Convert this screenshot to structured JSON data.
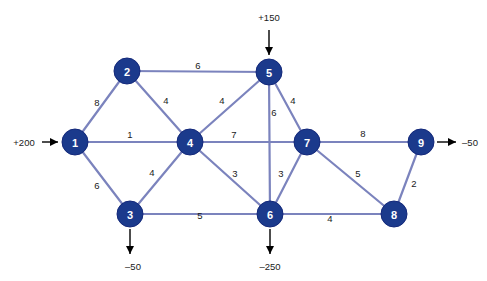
{
  "diagram": {
    "colors": {
      "node_fill": "#1b3a8c",
      "node_text": "#ffffff",
      "edge": "#7b83bd",
      "label": "#1a1a1a",
      "background": "#ffffff",
      "arrow": "#000000"
    },
    "nodes": [
      {
        "id": "1",
        "label": "1",
        "cx": 75,
        "cy": 142,
        "r": 13
      },
      {
        "id": "2",
        "label": "2",
        "cx": 127,
        "cy": 71,
        "r": 13
      },
      {
        "id": "3",
        "label": "3",
        "cx": 130,
        "cy": 214,
        "r": 13
      },
      {
        "id": "4",
        "label": "4",
        "cx": 190,
        "cy": 142,
        "r": 13
      },
      {
        "id": "5",
        "label": "5",
        "cx": 269,
        "cy": 72,
        "r": 13
      },
      {
        "id": "6",
        "label": "6",
        "cx": 270,
        "cy": 214,
        "r": 13
      },
      {
        "id": "7",
        "label": "7",
        "cx": 307,
        "cy": 142,
        "r": 13
      },
      {
        "id": "8",
        "label": "8",
        "cx": 394,
        "cy": 214,
        "r": 13
      },
      {
        "id": "9",
        "label": "9",
        "cx": 421,
        "cy": 142,
        "r": 13
      }
    ],
    "edges": [
      {
        "from": "1",
        "to": "2",
        "weight": "8",
        "lx": 97,
        "ly": 102
      },
      {
        "from": "1",
        "to": "4",
        "weight": "1",
        "lx": 130,
        "ly": 134
      },
      {
        "from": "1",
        "to": "3",
        "weight": "6",
        "lx": 97,
        "ly": 185
      },
      {
        "from": "2",
        "to": "5",
        "weight": "6",
        "lx": 198,
        "ly": 65
      },
      {
        "from": "2",
        "to": "4",
        "weight": "4",
        "lx": 166,
        "ly": 100
      },
      {
        "from": "3",
        "to": "4",
        "weight": "4",
        "lx": 152,
        "ly": 172
      },
      {
        "from": "3",
        "to": "6",
        "weight": "5",
        "lx": 200,
        "ly": 215
      },
      {
        "from": "4",
        "to": "5",
        "weight": "4",
        "lx": 222,
        "ly": 100
      },
      {
        "from": "4",
        "to": "7",
        "weight": "7",
        "lx": 234,
        "ly": 134
      },
      {
        "from": "4",
        "to": "6",
        "weight": "3",
        "lx": 235,
        "ly": 173
      },
      {
        "from": "5",
        "to": "6",
        "weight": "6",
        "lx": 274,
        "ly": 112
      },
      {
        "from": "5",
        "to": "7",
        "weight": "4",
        "lx": 293,
        "ly": 100
      },
      {
        "from": "6",
        "to": "7",
        "weight": "3",
        "lx": 281,
        "ly": 173
      },
      {
        "from": "6",
        "to": "8",
        "weight": "4",
        "lx": 330,
        "ly": 218
      },
      {
        "from": "7",
        "to": "8",
        "weight": "5",
        "lx": 358,
        "ly": 173
      },
      {
        "from": "7",
        "to": "9",
        "weight": "8",
        "lx": 363,
        "ly": 133
      },
      {
        "from": "8",
        "to": "9",
        "weight": "2",
        "lx": 414,
        "ly": 183
      }
    ],
    "flows": [
      {
        "name": "supply-node-1",
        "node": "1",
        "value": "+200",
        "direction": "right",
        "label_x": 24,
        "label_y": 142,
        "x1": 42,
        "y1": 142,
        "x2": 58,
        "y2": 142
      },
      {
        "name": "supply-node-5",
        "node": "5",
        "value": "+150",
        "direction": "down",
        "label_x": 269,
        "label_y": 17,
        "x1": 269,
        "y1": 30,
        "x2": 269,
        "y2": 55
      },
      {
        "name": "demand-node-3",
        "node": "3",
        "value": "–50",
        "direction": "down",
        "label_x": 133,
        "label_y": 266,
        "x1": 130,
        "y1": 229,
        "x2": 130,
        "y2": 254
      },
      {
        "name": "demand-node-6",
        "node": "6",
        "value": "–250",
        "direction": "down",
        "label_x": 270,
        "label_y": 266,
        "x1": 270,
        "y1": 229,
        "x2": 270,
        "y2": 254
      },
      {
        "name": "demand-node-9",
        "node": "9",
        "value": "–50",
        "direction": "right",
        "label_x": 470,
        "label_y": 142,
        "x1": 437,
        "y1": 142,
        "x2": 456,
        "y2": 142
      }
    ]
  }
}
